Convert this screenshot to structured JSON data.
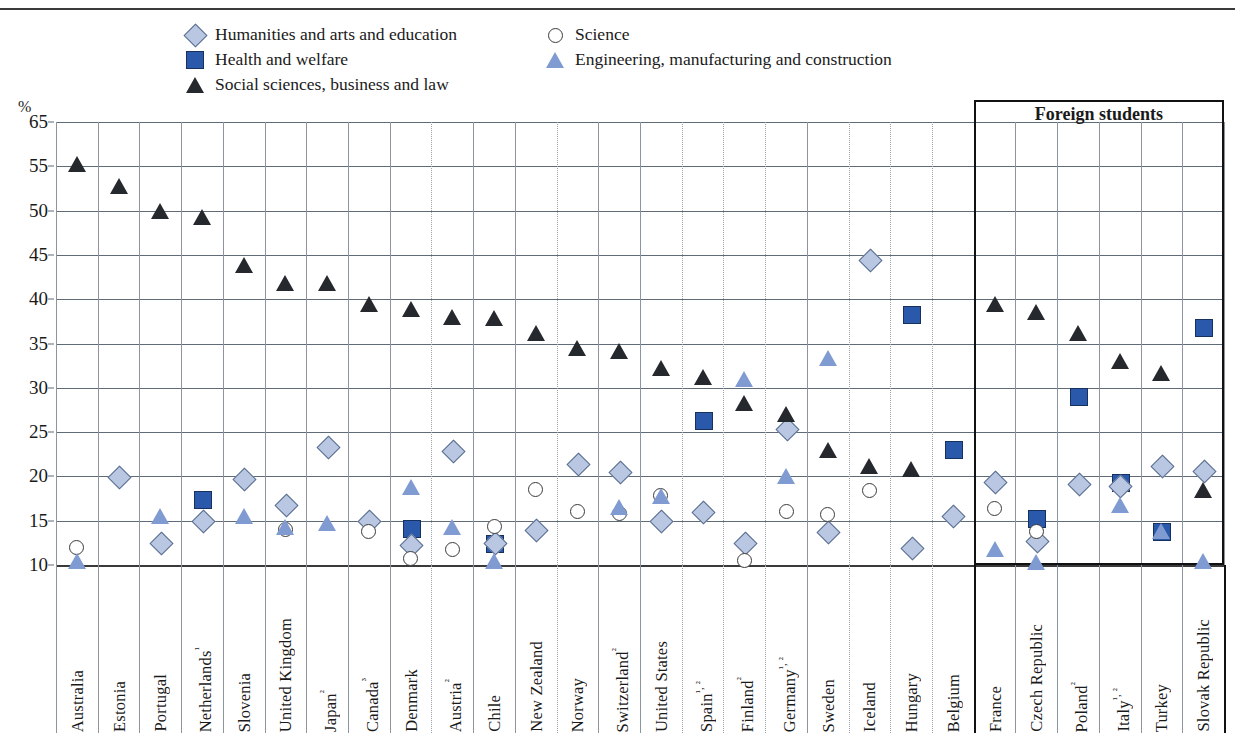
{
  "legend": {
    "items": [
      {
        "key": "humanities",
        "label": "Humanities and arts and education",
        "marker": "diamond-icon",
        "color": "#b9c7e2"
      },
      {
        "key": "health",
        "label": "Health and welfare",
        "marker": "square-icon",
        "color": "#2a59ab"
      },
      {
        "key": "social",
        "label": "Social sciences, business and law",
        "marker": "triangle-dark-icon",
        "color": "#25282c"
      },
      {
        "key": "science",
        "label": "Science",
        "marker": "circle-icon",
        "color": "#ffffff"
      },
      {
        "key": "engineering",
        "label": "Engineering, manufacturing and construction",
        "marker": "triangle-blue-icon",
        "color": "#7f9bd2"
      }
    ]
  },
  "axis": {
    "unit": "%",
    "yticks": [
      65,
      55,
      50,
      45,
      40,
      35,
      30,
      25,
      20,
      15,
      10
    ],
    "ymin": 10,
    "ymax": 65
  },
  "panel": {
    "foreign_students_title": "Foreign students"
  },
  "chart_data": {
    "type": "scatter",
    "title": "",
    "xlabel": "",
    "ylabel": "%",
    "ylim": [
      10,
      65
    ],
    "yticks": [
      65,
      55,
      50,
      45,
      40,
      35,
      30,
      25,
      20,
      15,
      10
    ],
    "grid": true,
    "legend_position": "top",
    "categories": [
      "Australia",
      "Estonia",
      "Portugal",
      "Netherlands¹",
      "Slovenia",
      "United Kingdom",
      "Japan²",
      "Canada³",
      "Denmark",
      "Austria²",
      "Chile",
      "New Zealand",
      "Norway",
      "Switzerland²",
      "United States",
      "Spain¹˒²",
      "Finland²",
      "Germany¹˒²",
      "Sweden",
      "Iceland",
      "Hungary",
      "Belgium",
      "France",
      "Czech Republic",
      "Poland²",
      "Italy¹˒²",
      "Turkey",
      "Slovak Republic"
    ],
    "foreign_students_group": [
      "France",
      "Czech Republic",
      "Poland²",
      "Italy¹˒²",
      "Turkey",
      "Slovak Republic"
    ],
    "series": [
      {
        "name": "Humanities and arts and education",
        "marker": "diamond",
        "values": [
          null,
          20.0,
          12.5,
          15.0,
          19.8,
          16.8,
          23.4,
          15.0,
          12.3,
          22.9,
          12.5,
          14.0,
          21.5,
          20.5,
          15.0,
          16.0,
          12.5,
          25.4,
          13.8,
          44.5,
          12.0,
          15.6,
          19.4,
          12.8,
          19.2,
          19.0,
          21.2,
          20.7
        ]
      },
      {
        "name": "Health and welfare",
        "marker": "square",
        "values": [
          null,
          null,
          null,
          17.5,
          null,
          null,
          null,
          null,
          14.2,
          null,
          12.5,
          null,
          null,
          null,
          null,
          26.4,
          null,
          null,
          null,
          null,
          38.3,
          23.1,
          null,
          15.3,
          29.1,
          19.4,
          13.8,
          36.9
        ]
      },
      {
        "name": "Social sciences, business and law",
        "marker": "triangle-dark",
        "values": [
          55.5,
          52.8,
          50.0,
          49.3,
          43.9,
          41.8,
          41.8,
          39.5,
          38.9,
          38.0,
          37.9,
          36.2,
          34.5,
          34.1,
          32.2,
          31.2,
          28.3,
          27.0,
          23.0,
          21.2,
          20.8,
          null,
          39.5,
          38.5,
          36.2,
          33.0,
          31.7,
          18.5
        ]
      },
      {
        "name": "Science",
        "marker": "circle",
        "values": [
          12.0,
          null,
          null,
          null,
          null,
          14.0,
          null,
          13.8,
          10.7,
          11.8,
          14.3,
          18.5,
          16.0,
          15.8,
          17.8,
          null,
          10.5,
          16.0,
          15.7,
          18.4,
          null,
          null,
          16.4,
          13.8,
          null,
          null,
          null,
          null
        ]
      },
      {
        "name": "Engineering, manufacturing and construction",
        "marker": "triangle-blue",
        "values": [
          10.5,
          null,
          15.5,
          null,
          15.5,
          14.3,
          14.7,
          null,
          18.8,
          14.3,
          10.5,
          null,
          null,
          16.5,
          17.8,
          null,
          31.0,
          20.0,
          33.4,
          null,
          null,
          null,
          11.8,
          10.3,
          null,
          16.8,
          13.8,
          10.5
        ]
      }
    ]
  }
}
